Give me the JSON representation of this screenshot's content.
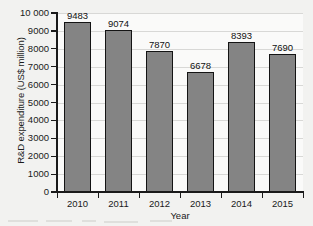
{
  "chart_data": {
    "type": "bar",
    "title": "",
    "xlabel": "Year",
    "ylabel": "R&D expenditure (US$ million)",
    "categories": [
      "2010",
      "2011",
      "2012",
      "2013",
      "2014",
      "2015"
    ],
    "values": [
      9483,
      9074,
      7870,
      6678,
      8393,
      7690
    ],
    "value_labels": [
      "9483",
      "9074",
      "7870",
      "6678",
      "8393",
      "7690"
    ],
    "ylim": [
      0,
      10000
    ],
    "ytick_values": [
      0,
      1000,
      2000,
      3000,
      4000,
      5000,
      6000,
      7000,
      8000,
      9000,
      10000
    ],
    "ytick_labels": [
      "0",
      "1000",
      "2000",
      "3000",
      "4000",
      "5000",
      "6000",
      "7000",
      "8000",
      "9000",
      "10 000"
    ],
    "grid": "horizontal",
    "legend": "none",
    "bar_color": "#848484",
    "bar_edge_color": "#141414",
    "gridline_color": "#d8d8d6",
    "axis_color": "#1a1a1a",
    "plot_background": "#fafaf9",
    "page_background": "#f2f2f0"
  }
}
